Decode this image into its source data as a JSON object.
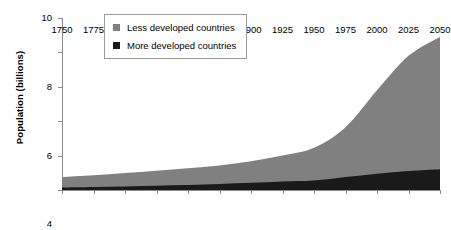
{
  "chart_data": {
    "type": "area",
    "stacked": true,
    "title": "",
    "xlabel": "",
    "ylabel": "Population (billions)",
    "xlim": [
      1750,
      2050
    ],
    "ylim": [
      0,
      10
    ],
    "ytick_labels": [
      "0",
      "2",
      "4",
      "6",
      "8",
      "10"
    ],
    "ytick_values": [
      0,
      2,
      4,
      6,
      8,
      10
    ],
    "xtick_labels": [
      "1750",
      "1775",
      "1800",
      "1825",
      "1850",
      "1875",
      "1900",
      "1925",
      "1950",
      "1975",
      "2000",
      "2025",
      "2050"
    ],
    "x": [
      1750,
      1775,
      1800,
      1825,
      1850,
      1875,
      1900,
      1925,
      1950,
      1975,
      2000,
      2025,
      2050
    ],
    "grid": false,
    "legend_position": "top-left",
    "series": [
      {
        "name": "More developed countries",
        "color": "#1a1a1a",
        "values": [
          0.15,
          0.18,
          0.21,
          0.25,
          0.29,
          0.35,
          0.42,
          0.5,
          0.55,
          0.75,
          0.95,
          1.1,
          1.2
        ]
      },
      {
        "name": "Less developed countries",
        "color": "#808080",
        "values": [
          0.6,
          0.68,
          0.78,
          0.87,
          0.97,
          1.07,
          1.25,
          1.5,
          1.9,
          2.9,
          4.85,
          6.7,
          7.7
        ]
      }
    ],
    "totals": [
      0.75,
      0.86,
      0.99,
      1.12,
      1.26,
      1.42,
      1.67,
      2.0,
      2.45,
      3.65,
      5.8,
      7.8,
      8.9
    ]
  },
  "legend": {
    "entries": [
      {
        "label": "Less developed countries",
        "color": "#808080"
      },
      {
        "label": "More developed countries",
        "color": "#1a1a1a"
      }
    ]
  }
}
